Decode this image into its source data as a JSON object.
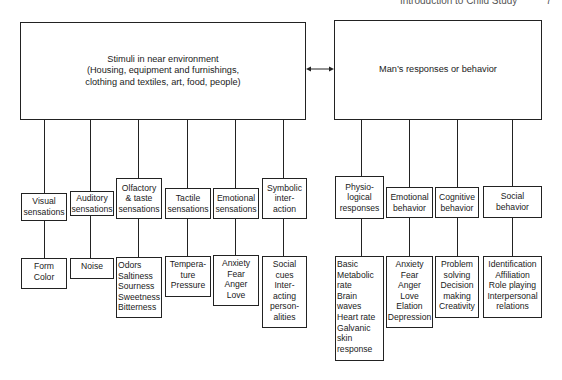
{
  "header": {
    "title": "Introduction to Child Study",
    "page": "7"
  },
  "environment_box": "Stimuli in near environment\n(Housing, equipment and furnishings,\nclothing and textiles, art, food, people)",
  "response_box": "Man’s responses or behavior",
  "stimuli": [
    {
      "label": "Visual\nsensations",
      "items": "Form\nColor"
    },
    {
      "label": "Auditory\nsensations",
      "items": "Noise"
    },
    {
      "label": "Olfactory\n& taste\nsensations",
      "items": "  Odors\nSaltiness\nSourness\nSweetness\nBitterness"
    },
    {
      "label": "Tactile\nsensations",
      "items": "Tempera-\nture\nPressure"
    },
    {
      "label": "Emotional\nsensations",
      "items": "Anxiety\nFear\nAnger\nLove"
    },
    {
      "label": "Symbolic\ninter-\naction",
      "items": "Social\ncues\nInter-\nacting\nperson-\nalities"
    }
  ],
  "responses": [
    {
      "label": "Physio-\nlogical\nresponses",
      "items": "Basic\n  Metabolic\n  rate\nBrain\n  waves\nHeart rate\nGalvanic\n  skin\n  response"
    },
    {
      "label": "Emotional\nbehavior",
      "items": "Anxiety\nFear\nAnger\nLove\nElation\nDepression"
    },
    {
      "label": "Cognitive\nbehavior",
      "items": "Problem\nsolving\nDecision\nmaking\nCreativity"
    },
    {
      "label": "Social\nbehavior",
      "items": "Identification\nAffiliation\nRole playing\nInterpersonal\nrelations"
    }
  ]
}
